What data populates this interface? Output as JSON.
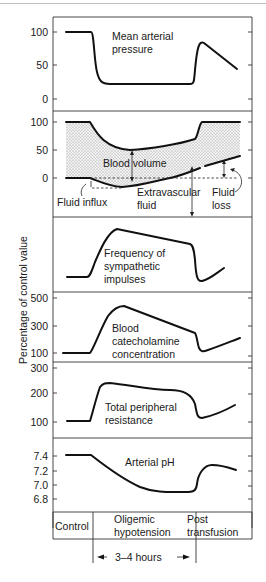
{
  "figure": {
    "y_axis_label": "Percentage of control value",
    "phases": [
      "Control",
      "Oligemic hypotension",
      "Post transfusion"
    ],
    "phase_lines": {
      "oligemic_1": "Oligemic",
      "oligemic_2": "hypotension",
      "post_1": "Post",
      "post_2": "transfusion"
    },
    "duration_label": "3–4 hours"
  },
  "panels": [
    {
      "id": "map",
      "title_lines": [
        "Mean arterial",
        "pressure"
      ],
      "ticks": [
        "100",
        "50",
        "0"
      ]
    },
    {
      "id": "blood-volume",
      "ticks": [
        "100",
        "50",
        "0"
      ],
      "annotations": {
        "blood_volume": "Blood volume",
        "fluid_influx": "Fluid influx",
        "extravascular_1": "Extravascular",
        "extravascular_2": "fluid",
        "fluid_loss_1": "Fluid",
        "fluid_loss_2": "loss"
      }
    },
    {
      "id": "sympathetic",
      "title_lines": [
        "Frequency of",
        "sympathetic",
        "impulses"
      ],
      "ticks": []
    },
    {
      "id": "catecholamine",
      "title_lines": [
        "Blood",
        "catecholamine",
        "concentration"
      ],
      "ticks": [
        "500",
        "300",
        "100"
      ]
    },
    {
      "id": "tpr",
      "title_lines": [
        "Total peripheral",
        "resistance"
      ],
      "ticks": [
        "300",
        "200",
        "100"
      ]
    },
    {
      "id": "ph",
      "title_lines": [
        "Arterial pH"
      ],
      "ticks": [
        "7.4",
        "7.2",
        "7.0",
        "6.8"
      ]
    }
  ]
}
